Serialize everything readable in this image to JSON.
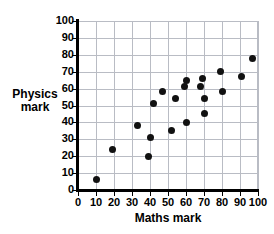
{
  "chart_data": {
    "type": "scatter",
    "title": "",
    "xlabel": "Maths mark",
    "ylabel_lines": [
      "Physics",
      "mark"
    ],
    "ylabel": "Physics mark",
    "xlim": [
      0,
      100
    ],
    "ylim": [
      0,
      100
    ],
    "grid": true,
    "legend": null,
    "xticks": [
      0,
      10,
      20,
      30,
      40,
      50,
      60,
      70,
      80,
      90,
      100
    ],
    "yticks": [
      0,
      10,
      20,
      30,
      40,
      50,
      60,
      70,
      80,
      90,
      100
    ],
    "xtick_labels": [
      "0",
      "10",
      "20",
      "30",
      "40",
      "50",
      "60",
      "70",
      "80",
      "90",
      "100"
    ],
    "ytick_labels": [
      "0",
      "10",
      "20",
      "30",
      "40",
      "50",
      "60",
      "70",
      "80",
      "90",
      "100"
    ],
    "marker": "filled-circle",
    "marker_color": "#111111",
    "grid_color": "#b9bcc4",
    "axis_color": "#000000",
    "points": [
      {
        "x": 10,
        "y": 6
      },
      {
        "x": 19,
        "y": 24
      },
      {
        "x": 33,
        "y": 38
      },
      {
        "x": 39,
        "y": 20
      },
      {
        "x": 40,
        "y": 31
      },
      {
        "x": 42,
        "y": 51
      },
      {
        "x": 47,
        "y": 58
      },
      {
        "x": 52,
        "y": 35
      },
      {
        "x": 54,
        "y": 54
      },
      {
        "x": 59,
        "y": 61
      },
      {
        "x": 60,
        "y": 40
      },
      {
        "x": 60,
        "y": 65
      },
      {
        "x": 68,
        "y": 61
      },
      {
        "x": 69,
        "y": 66
      },
      {
        "x": 70,
        "y": 54
      },
      {
        "x": 70,
        "y": 45
      },
      {
        "x": 79,
        "y": 70
      },
      {
        "x": 80,
        "y": 58
      },
      {
        "x": 91,
        "y": 67
      },
      {
        "x": 97,
        "y": 78
      }
    ]
  }
}
